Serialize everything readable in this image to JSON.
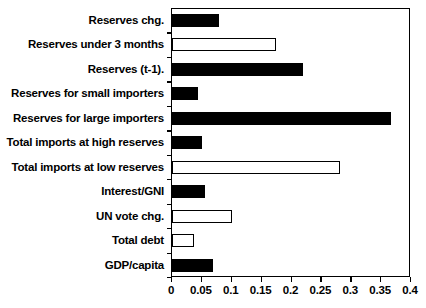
{
  "chart_data": {
    "type": "bar",
    "orientation": "horizontal",
    "title": "",
    "subtitle": "",
    "xlabel": "",
    "ylabel": "",
    "xlim": [
      0,
      0.4
    ],
    "ylim": null,
    "grid": false,
    "legend": null,
    "xticks": [
      "0",
      "0.05",
      "0.1",
      "0.15",
      "0.2",
      "0.25",
      "0.3",
      "0.35",
      "0.4"
    ],
    "xtickvalues": [
      0,
      0.05,
      0.1,
      0.15,
      0.2,
      0.25,
      0.3,
      0.35,
      0.4
    ],
    "categories": [
      "Reserves chg.",
      "Reserves under 3 months",
      "Reserves (t-1).",
      "Reserves for small importers",
      "Reserves for large importers",
      "Total imports at high reserves",
      "Total imports at low reserves",
      "Interest/GNI",
      "UN vote chg.",
      "Total debt",
      "GDP/capita"
    ],
    "values": [
      0.078,
      0.174,
      0.219,
      0.044,
      0.366,
      0.051,
      0.282,
      0.056,
      0.1,
      0.037,
      0.069
    ],
    "bar_styles": [
      "filled",
      "hollow",
      "filled",
      "filled",
      "filled",
      "filled",
      "hollow",
      "filled",
      "hollow",
      "hollow",
      "filled"
    ],
    "colors": {
      "filled": "#000000",
      "hollow": "#ffffff",
      "outline": "#000000",
      "axis": "#000000",
      "background": "#ffffff"
    }
  }
}
